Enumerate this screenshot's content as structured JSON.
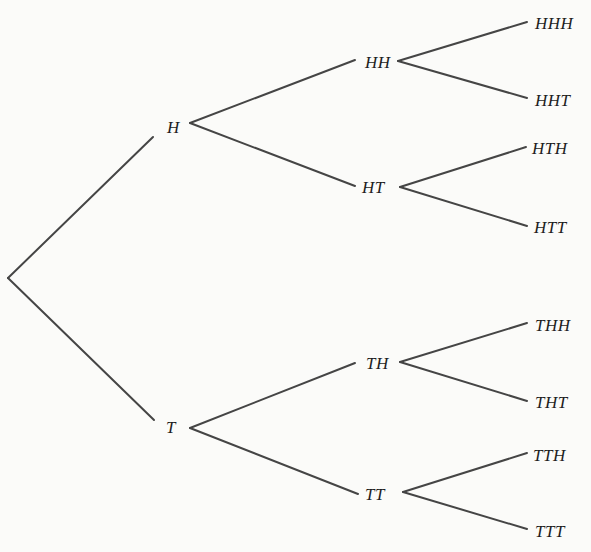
{
  "diagram": {
    "type": "tree",
    "colors": {
      "background": "#fbfbf9",
      "edge": "#454545",
      "text": "#1e1e1e"
    },
    "root": {
      "x": 8,
      "y": 278
    },
    "nodes": {
      "level1": [
        {
          "id": "H",
          "label": "H",
          "x": 167,
          "y": 119
        },
        {
          "id": "T",
          "label": "T",
          "x": 166,
          "y": 419
        }
      ],
      "level2": [
        {
          "id": "HH",
          "label": "HH",
          "x": 365,
          "y": 54
        },
        {
          "id": "HT",
          "label": "HT",
          "x": 362,
          "y": 179
        },
        {
          "id": "TH",
          "label": "TH",
          "x": 366,
          "y": 355
        },
        {
          "id": "TT",
          "label": "TT",
          "x": 365,
          "y": 486
        }
      ],
      "level3": [
        {
          "id": "HHH",
          "label": "HHH",
          "x": 535,
          "y": 15
        },
        {
          "id": "HHT",
          "label": "HHT",
          "x": 535,
          "y": 92
        },
        {
          "id": "HTH",
          "label": "HTH",
          "x": 532,
          "y": 140
        },
        {
          "id": "HTT",
          "label": "HTT",
          "x": 534,
          "y": 219
        },
        {
          "id": "THH",
          "label": "THH",
          "x": 535,
          "y": 317
        },
        {
          "id": "THT",
          "label": "THT",
          "x": 535,
          "y": 394
        },
        {
          "id": "TTH",
          "label": "TTH",
          "x": 533,
          "y": 447
        },
        {
          "id": "TTT",
          "label": "TTT",
          "x": 535,
          "y": 523
        }
      ]
    },
    "edges": [
      {
        "from": "root",
        "to": "H",
        "x1": 8,
        "y1": 278,
        "x2": 153,
        "y2": 137
      },
      {
        "from": "root",
        "to": "T",
        "x1": 8,
        "y1": 278,
        "x2": 154,
        "y2": 420
      },
      {
        "from": "H",
        "to": "HH",
        "x1": 190,
        "y1": 123,
        "x2": 355,
        "y2": 60
      },
      {
        "from": "H",
        "to": "HT",
        "x1": 190,
        "y1": 123,
        "x2": 355,
        "y2": 186
      },
      {
        "from": "T",
        "to": "TH",
        "x1": 190,
        "y1": 428,
        "x2": 355,
        "y2": 363
      },
      {
        "from": "T",
        "to": "TT",
        "x1": 190,
        "y1": 428,
        "x2": 358,
        "y2": 494
      },
      {
        "from": "HH",
        "to": "HHH",
        "x1": 398,
        "y1": 61,
        "x2": 527,
        "y2": 22
      },
      {
        "from": "HH",
        "to": "HHT",
        "x1": 398,
        "y1": 61,
        "x2": 527,
        "y2": 98
      },
      {
        "from": "HT",
        "to": "HTH",
        "x1": 400,
        "y1": 187,
        "x2": 526,
        "y2": 147
      },
      {
        "from": "HT",
        "to": "HTT",
        "x1": 400,
        "y1": 187,
        "x2": 527,
        "y2": 226
      },
      {
        "from": "TH",
        "to": "THH",
        "x1": 400,
        "y1": 362,
        "x2": 527,
        "y2": 323
      },
      {
        "from": "TH",
        "to": "THT",
        "x1": 400,
        "y1": 362,
        "x2": 527,
        "y2": 401
      },
      {
        "from": "TT",
        "to": "TTH",
        "x1": 403,
        "y1": 492,
        "x2": 527,
        "y2": 453
      },
      {
        "from": "TT",
        "to": "TTT",
        "x1": 403,
        "y1": 492,
        "x2": 527,
        "y2": 529
      }
    ]
  }
}
